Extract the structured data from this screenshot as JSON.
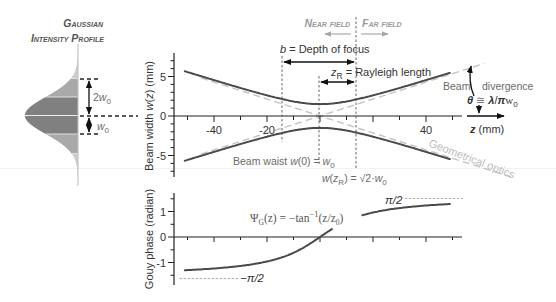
{
  "profile": {
    "title_line1": "Gaussian",
    "title_line2": "Intensity Profile",
    "label_2w0": {
      "coef": "2",
      "var": "w",
      "sub": "0"
    },
    "label_w0": {
      "var": "w",
      "sub": "0"
    }
  },
  "field_labels": {
    "near": "Near field",
    "far": "Far field"
  },
  "beam_panel": {
    "ylabel": {
      "prefix": "Beam width ",
      "var": "w",
      "open": "(",
      "arg": "z",
      "suffix": ") (mm)"
    },
    "xlabel": {
      "var": "z",
      "suffix": " (mm)"
    },
    "depth_of_focus": {
      "var": "b",
      "text": " = Depth of focus"
    },
    "rayleigh": {
      "var": "z",
      "sub": "R",
      "text": " = Rayleigh length"
    },
    "beam_waist": {
      "prefix": "Beam waist ",
      "var": "w",
      "mid": "(0) = ",
      "var2": "w",
      "sub": "0"
    },
    "w_at_zr": {
      "var": "w",
      "open": "(",
      "arg": "z",
      "sub": "R",
      "mid": ") = √2·",
      "var2": "w",
      "sub2": "0"
    },
    "divergence": {
      "word1": "Beam",
      "word2": "divergence",
      "theta": "θ",
      "approx": " ≅ ",
      "lambda": "λ",
      "slash": "/",
      "pi": "π",
      "w": "w",
      "sub": "0"
    },
    "geometrical_optics": "Geometrical optics"
  },
  "phase_panel": {
    "ylabel": "Gouy phase (radian)",
    "formula": {
      "psi": "Ψ",
      "sub": "G",
      "rest": "(z) = −tan",
      "sup": "−1",
      "arg": "(z/z",
      "argsub": "0",
      "close": ")"
    },
    "pi_half": "π/2",
    "neg_pi_half": "−π/2"
  },
  "colors": {
    "curve": "#4a4a4a",
    "asymptote": "#c4c4c4",
    "band_dark": "#808080",
    "band_mid": "#a9a9a9",
    "band_light": "#cdcdcd",
    "field_label": "#9a9a9a"
  },
  "chart_data": [
    {
      "type": "line",
      "title": "",
      "xlabel": "z (mm)",
      "ylabel": "Beam width w(z) (mm)",
      "xlim": [
        -50,
        50
      ],
      "ylim": [
        -8,
        8
      ],
      "grid": false,
      "x_ticks": [
        -50,
        -40,
        -30,
        -20,
        -10,
        0,
        10,
        20,
        30,
        40,
        50
      ],
      "x_tick_labels": [
        {
          "value": -40,
          "label": "-40"
        },
        {
          "value": -20,
          "label": "-20"
        },
        {
          "value": 40,
          "label": "40"
        }
      ],
      "y_minor_ticks": [
        -7,
        -6,
        -5,
        -4,
        -3,
        -2,
        -1,
        0,
        1,
        2,
        3,
        4,
        5,
        6,
        7
      ],
      "y_tick_labels": [
        {
          "value": 5,
          "label": "5"
        },
        {
          "value": 0,
          "label": "0"
        },
        {
          "value": -5,
          "label": "-5"
        }
      ],
      "params": {
        "w0": 1.5,
        "zR": 14
      },
      "curve_z": [
        -51,
        49
      ],
      "asymptote_z_extent": [
        [
          -45,
          62
        ],
        [
          -45,
          72
        ]
      ],
      "x": [
        -50,
        -40,
        -30,
        -20,
        -10,
        0,
        10,
        20,
        30,
        40,
        50
      ],
      "series": [
        {
          "name": "w(z) upper envelope",
          "values": [
            5.56,
            4.54,
            3.55,
            2.62,
            1.84,
            1.5,
            1.84,
            2.62,
            3.55,
            4.54,
            5.56
          ]
        },
        {
          "name": "-w(z) lower envelope",
          "values": [
            -5.56,
            -4.54,
            -3.55,
            -2.62,
            -1.84,
            -1.5,
            -1.84,
            -2.62,
            -3.55,
            -4.54,
            -5.56
          ]
        },
        {
          "name": "Geometrical optics asymptote (+)",
          "values": [
            -5.36,
            -4.29,
            -3.21,
            -2.14,
            -1.07,
            0,
            1.07,
            2.14,
            3.21,
            4.29,
            5.36
          ]
        },
        {
          "name": "Geometrical optics asymptote (-)",
          "values": [
            5.36,
            4.29,
            3.21,
            2.14,
            1.07,
            0,
            -1.07,
            -2.14,
            -3.21,
            -4.29,
            -5.36
          ]
        }
      ],
      "markers": {
        "depth_of_focus_z": [
          -14,
          14
        ],
        "rayleigh_length_z": [
          0,
          14
        ],
        "near_far_boundary_z": 14
      },
      "annotations": [
        "b = Depth of focus",
        "zR = Rayleigh length",
        "Beam waist w(0) = w0",
        "w(zR) = √2·w0",
        "Beam divergence θ ≅ λ/πw0",
        "Geometrical optics",
        "Near field",
        "Far field"
      ]
    },
    {
      "type": "line",
      "title": "",
      "xlabel": "z (mm)",
      "ylabel": "Gouy phase (radian)",
      "xlim": [
        -50,
        50
      ],
      "ylim": [
        -1.8,
        1.8
      ],
      "grid": false,
      "x_ticks": [
        -50,
        -40,
        -30,
        -20,
        -10,
        0,
        10,
        20,
        30,
        40,
        50
      ],
      "y_minor_ticks": [
        -1.5,
        -0.5,
        0.5,
        1.5
      ],
      "y_tick_labels": [
        {
          "value": 1,
          "label": "1"
        },
        {
          "value": 0,
          "label": "0"
        },
        {
          "value": -1,
          "label": "-1"
        }
      ],
      "params": {
        "zR": 14
      },
      "curve_z": [
        -51,
        49
      ],
      "curve_gap": [
        4.9,
        15.8
      ],
      "x": [
        -50,
        -40,
        -30,
        -20,
        -10,
        0,
        10,
        20,
        30,
        40,
        50
      ],
      "series": [
        {
          "name": "Gouy phase",
          "values": [
            -1.298,
            -1.234,
            -1.134,
            -0.96,
            -0.62,
            0,
            0.62,
            0.96,
            1.134,
            1.234,
            1.298
          ]
        }
      ],
      "asymptotes": [
        {
          "label": "π/2",
          "value": 1.5708,
          "z_extent": [
            32,
            54
          ]
        },
        {
          "label": "−π/2",
          "value": -1.5708,
          "z_extent": [
            -53,
            -31
          ]
        }
      ],
      "annotations": [
        "ΨG(z) = −tan−1(z/z0)",
        "π/2",
        "−π/2"
      ]
    }
  ]
}
